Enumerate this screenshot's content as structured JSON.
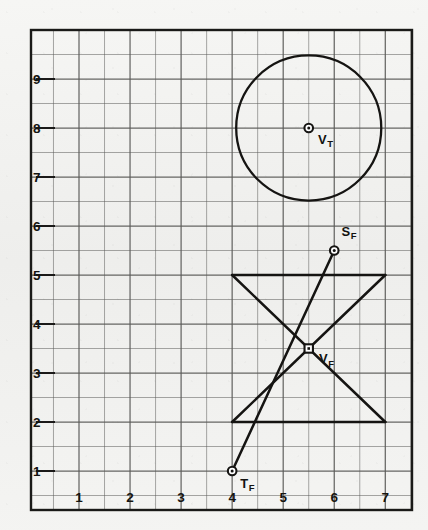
{
  "figure": {
    "background_color": "#f2f2f0",
    "ink_color": "#151412",
    "grid_line_color": "#5a5a58",
    "border_color": "#1a1a18"
  },
  "chart_data": {
    "type": "scatter",
    "title": "",
    "xlabel": "",
    "ylabel": "",
    "xlim": [
      0.4,
      7.6
    ],
    "ylim": [
      0.3,
      9.9
    ],
    "grid": true,
    "grid_major_step": 1,
    "grid_minor_step": 0.5,
    "legend": "none",
    "x_ticks": [
      1,
      2,
      3,
      4,
      5,
      6,
      7
    ],
    "x_tick_labels": [
      "1",
      "2",
      "3",
      "4",
      "5",
      "6",
      "7"
    ],
    "y_ticks": [
      1,
      2,
      3,
      4,
      5,
      6,
      7,
      8,
      9
    ],
    "y_tick_labels": [
      "1",
      "2",
      "3",
      "4",
      "5",
      "6",
      "7",
      "8",
      "9"
    ],
    "points": [
      {
        "id": "VT",
        "label": "V",
        "subscript": "T",
        "x": 5.5,
        "y": 8.0,
        "marker": "circle-dot",
        "label_dx": 0.18,
        "label_dy": -0.32
      },
      {
        "id": "SF",
        "label": "S",
        "subscript": "F",
        "x": 6.0,
        "y": 5.5,
        "marker": "circle-dot",
        "label_dx": 0.14,
        "label_dy": 0.3
      },
      {
        "id": "VF",
        "label": "V",
        "subscript": "F",
        "x": 5.5,
        "y": 3.5,
        "marker": "square-dot",
        "label_dx": 0.2,
        "label_dy": -0.3
      },
      {
        "id": "TF",
        "label": "T",
        "subscript": "F",
        "x": 4.0,
        "y": 1.0,
        "marker": "circle-dot",
        "label_dx": 0.16,
        "label_dy": -0.34
      }
    ],
    "shapes": [
      {
        "id": "top-circle",
        "type": "circle",
        "cx": 5.5,
        "cy": 8.0,
        "r": 1.45
      },
      {
        "id": "bowtie-top-edge",
        "type": "line",
        "x1": 4.0,
        "y1": 5.0,
        "x2": 7.0,
        "y2": 5.0
      },
      {
        "id": "bowtie-bottom-edge",
        "type": "line",
        "x1": 4.0,
        "y1": 2.0,
        "x2": 7.0,
        "y2": 2.0
      },
      {
        "id": "bowtie-diagonal-down",
        "type": "line",
        "x1": 4.0,
        "y1": 5.0,
        "x2": 7.0,
        "y2": 2.0
      },
      {
        "id": "bowtie-diagonal-up",
        "type": "line",
        "x1": 4.0,
        "y1": 2.0,
        "x2": 7.0,
        "y2": 5.0
      },
      {
        "id": "projector-TF-SF",
        "type": "line",
        "x1": 4.0,
        "y1": 1.0,
        "x2": 6.0,
        "y2": 5.5
      }
    ]
  }
}
